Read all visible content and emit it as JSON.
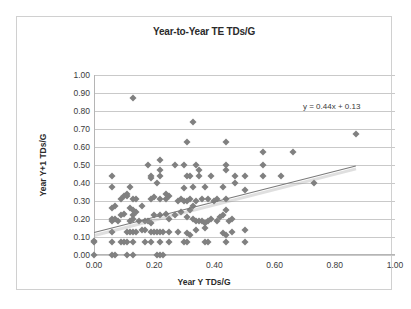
{
  "chart_data": {
    "type": "scatter",
    "title": "Year-to-Year TE TDs/G",
    "xlabel": "Year Y TDs/G",
    "ylabel": "Year Y+1 TDs/G",
    "xlim": [
      0.0,
      1.0
    ],
    "ylim": [
      0.0,
      1.0
    ],
    "xticks": [
      "0.00",
      "0.20",
      "0.40",
      "0.60",
      "0.80",
      "1.00"
    ],
    "xtick_values": [
      0.0,
      0.2,
      0.4,
      0.6,
      0.8,
      1.0
    ],
    "yticks": [
      "0.00",
      "0.10",
      "0.20",
      "0.30",
      "0.40",
      "0.50",
      "0.60",
      "0.70",
      "0.80",
      "0.90",
      "1.00"
    ],
    "ytick_values": [
      0.0,
      0.1,
      0.2,
      0.3,
      0.4,
      0.5,
      0.6,
      0.7,
      0.8,
      0.9,
      1.0
    ],
    "grid": "horizontal",
    "legend": "none",
    "annotation": "y = 0.44x + 0.13",
    "trendline": {
      "slope": 0.44,
      "intercept": 0.13,
      "x_start": 0.0,
      "x_end": 0.87,
      "y_start": 0.13,
      "y_end": 0.5,
      "color": "#7a7a7a"
    },
    "marker": {
      "shape": "diamond",
      "color": "#808080",
      "size": 5
    },
    "points": [
      [
        0.0,
        0.0
      ],
      [
        0.0,
        0.08
      ],
      [
        0.06,
        0.0
      ],
      [
        0.07,
        0.0
      ],
      [
        0.11,
        0.0
      ],
      [
        0.13,
        0.0
      ],
      [
        0.21,
        0.0
      ],
      [
        0.22,
        0.0
      ],
      [
        0.23,
        0.0
      ],
      [
        0.0,
        0.07
      ],
      [
        0.06,
        0.07
      ],
      [
        0.09,
        0.07
      ],
      [
        0.1,
        0.07
      ],
      [
        0.11,
        0.07
      ],
      [
        0.13,
        0.07
      ],
      [
        0.17,
        0.07
      ],
      [
        0.19,
        0.07
      ],
      [
        0.22,
        0.07
      ],
      [
        0.25,
        0.07
      ],
      [
        0.3,
        0.07
      ],
      [
        0.31,
        0.07
      ],
      [
        0.37,
        0.07
      ],
      [
        0.38,
        0.07
      ],
      [
        0.44,
        0.07
      ],
      [
        0.5,
        0.07
      ],
      [
        0.06,
        0.13
      ],
      [
        0.11,
        0.13
      ],
      [
        0.12,
        0.13
      ],
      [
        0.13,
        0.13
      ],
      [
        0.14,
        0.13
      ],
      [
        0.16,
        0.14
      ],
      [
        0.17,
        0.14
      ],
      [
        0.19,
        0.13
      ],
      [
        0.2,
        0.13
      ],
      [
        0.21,
        0.13
      ],
      [
        0.22,
        0.13
      ],
      [
        0.23,
        0.13
      ],
      [
        0.25,
        0.13
      ],
      [
        0.28,
        0.13
      ],
      [
        0.31,
        0.12
      ],
      [
        0.32,
        0.11
      ],
      [
        0.34,
        0.14
      ],
      [
        0.37,
        0.15
      ],
      [
        0.43,
        0.12
      ],
      [
        0.44,
        0.11
      ],
      [
        0.46,
        0.13
      ],
      [
        0.5,
        0.14
      ],
      [
        0.06,
        0.19
      ],
      [
        0.06,
        0.2
      ],
      [
        0.07,
        0.2
      ],
      [
        0.08,
        0.19
      ],
      [
        0.09,
        0.22
      ],
      [
        0.1,
        0.23
      ],
      [
        0.12,
        0.19
      ],
      [
        0.13,
        0.2
      ],
      [
        0.13,
        0.22
      ],
      [
        0.14,
        0.24
      ],
      [
        0.15,
        0.19
      ],
      [
        0.17,
        0.19
      ],
      [
        0.18,
        0.19
      ],
      [
        0.19,
        0.18
      ],
      [
        0.2,
        0.22
      ],
      [
        0.22,
        0.22
      ],
      [
        0.24,
        0.23
      ],
      [
        0.25,
        0.2
      ],
      [
        0.27,
        0.22
      ],
      [
        0.29,
        0.24
      ],
      [
        0.31,
        0.21
      ],
      [
        0.32,
        0.25
      ],
      [
        0.33,
        0.2
      ],
      [
        0.34,
        0.19
      ],
      [
        0.35,
        0.19
      ],
      [
        0.36,
        0.19
      ],
      [
        0.37,
        0.18
      ],
      [
        0.38,
        0.19
      ],
      [
        0.39,
        0.2
      ],
      [
        0.41,
        0.19
      ],
      [
        0.42,
        0.21
      ],
      [
        0.43,
        0.22
      ],
      [
        0.44,
        0.25
      ],
      [
        0.45,
        0.19
      ],
      [
        0.46,
        0.2
      ],
      [
        0.06,
        0.26
      ],
      [
        0.07,
        0.27
      ],
      [
        0.09,
        0.31
      ],
      [
        0.1,
        0.33
      ],
      [
        0.11,
        0.33
      ],
      [
        0.12,
        0.26
      ],
      [
        0.13,
        0.25
      ],
      [
        0.13,
        0.31
      ],
      [
        0.14,
        0.31
      ],
      [
        0.16,
        0.27
      ],
      [
        0.19,
        0.31
      ],
      [
        0.2,
        0.32
      ],
      [
        0.22,
        0.31
      ],
      [
        0.24,
        0.31
      ],
      [
        0.25,
        0.33
      ],
      [
        0.28,
        0.3
      ],
      [
        0.29,
        0.31
      ],
      [
        0.3,
        0.3
      ],
      [
        0.31,
        0.3
      ],
      [
        0.32,
        0.31
      ],
      [
        0.33,
        0.27
      ],
      [
        0.34,
        0.3
      ],
      [
        0.36,
        0.31
      ],
      [
        0.38,
        0.31
      ],
      [
        0.4,
        0.3
      ],
      [
        0.41,
        0.31
      ],
      [
        0.44,
        0.31
      ],
      [
        0.06,
        0.38
      ],
      [
        0.11,
        0.34
      ],
      [
        0.12,
        0.38
      ],
      [
        0.19,
        0.43
      ],
      [
        0.21,
        0.4
      ],
      [
        0.22,
        0.47
      ],
      [
        0.24,
        0.34
      ],
      [
        0.3,
        0.37
      ],
      [
        0.33,
        0.38
      ],
      [
        0.35,
        0.44
      ],
      [
        0.37,
        0.38
      ],
      [
        0.39,
        0.44
      ],
      [
        0.43,
        0.38
      ],
      [
        0.47,
        0.4
      ],
      [
        0.5,
        0.36
      ],
      [
        0.56,
        0.44
      ],
      [
        0.62,
        0.44
      ],
      [
        0.73,
        0.4
      ],
      [
        0.06,
        0.44
      ],
      [
        0.19,
        0.44
      ],
      [
        0.22,
        0.44
      ],
      [
        0.31,
        0.44
      ],
      [
        0.32,
        0.44
      ],
      [
        0.35,
        0.47
      ],
      [
        0.44,
        0.47
      ],
      [
        0.47,
        0.44
      ],
      [
        0.5,
        0.44
      ],
      [
        0.18,
        0.5
      ],
      [
        0.22,
        0.53
      ],
      [
        0.27,
        0.5
      ],
      [
        0.3,
        0.5
      ],
      [
        0.34,
        0.5
      ],
      [
        0.44,
        0.5
      ],
      [
        0.56,
        0.5
      ],
      [
        0.31,
        0.63
      ],
      [
        0.44,
        0.63
      ],
      [
        0.56,
        0.57
      ],
      [
        0.66,
        0.57
      ],
      [
        0.33,
        0.74
      ],
      [
        0.87,
        0.67
      ],
      [
        0.13,
        0.87
      ]
    ]
  }
}
